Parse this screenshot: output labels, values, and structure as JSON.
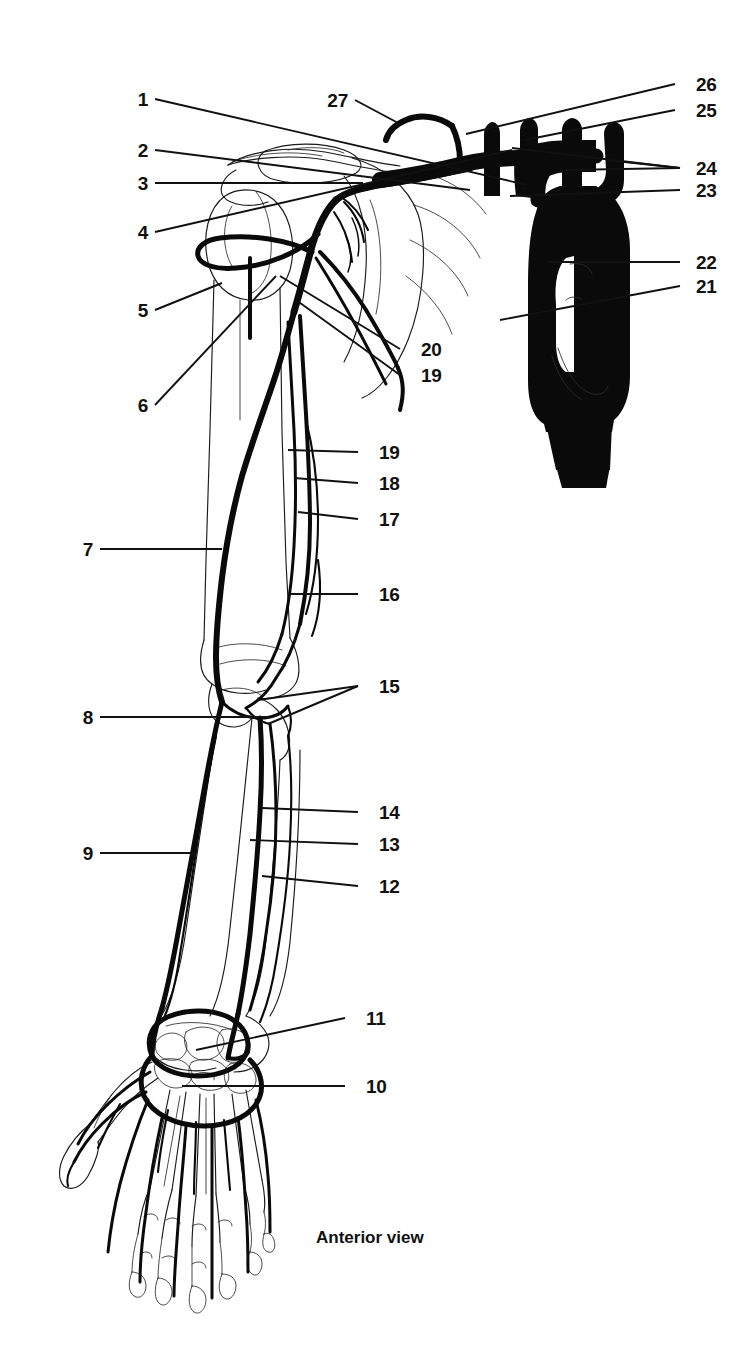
{
  "figure": {
    "title_caption": "Anterior view",
    "view": "Anterior view",
    "ink_color": "#0a0a0a",
    "background_color": "#ffffff",
    "label_count": 27
  },
  "labels": {
    "n1": "1",
    "n2": "2",
    "n3": "3",
    "n4": "4",
    "n5": "5",
    "n6": "6",
    "n7": "7",
    "n8": "8",
    "n9": "9",
    "n10": "10",
    "n11": "11",
    "n12": "12",
    "n13": "13",
    "n14": "14",
    "n15": "15",
    "n16": "16",
    "n17": "17",
    "n18": "18",
    "n19": "19",
    "n19b": "19",
    "n20": "20",
    "n21": "21",
    "n22": "22",
    "n23": "23",
    "n24": "24",
    "n25": "25",
    "n26": "26",
    "n27": "27"
  },
  "label_layout": {
    "left_column_upper": [
      "1",
      "2",
      "3",
      "4",
      "5",
      "6"
    ],
    "left_column_lower": [
      "7",
      "8",
      "9"
    ],
    "right_column_mid": [
      "20",
      "19",
      "19",
      "18",
      "17",
      "16",
      "15",
      "14",
      "13",
      "12",
      "11",
      "10"
    ],
    "right_column_far": [
      "26",
      "25",
      "24",
      "23",
      "22",
      "21"
    ],
    "top_center": [
      "27"
    ]
  }
}
